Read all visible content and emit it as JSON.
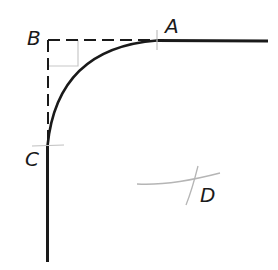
{
  "diagram": {
    "type": "geometric construction - tangent arc connecting two perpendicular lines",
    "labels": {
      "A": "A",
      "B": "B",
      "C": "C",
      "D": "D"
    },
    "points": {
      "A": {
        "x": 157,
        "y": 40,
        "role": "tangent point on horizontal line"
      },
      "B": {
        "x": 48,
        "y": 40,
        "role": "corner of right angle (extended lines meet)"
      },
      "C": {
        "x": 48,
        "y": 145,
        "role": "tangent point on vertical line"
      },
      "D": {
        "x": 190,
        "y": 182,
        "role": "construction mark / arc center"
      }
    },
    "colors": {
      "line": "#1a1a1a",
      "construction": "#b5b5b5"
    }
  }
}
